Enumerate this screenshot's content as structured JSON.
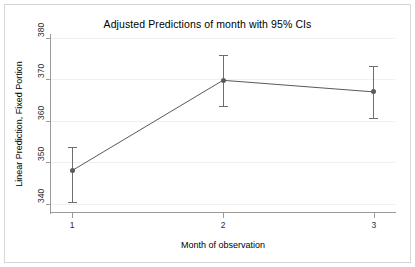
{
  "chart_data": {
    "type": "line",
    "title": "Adjusted Predictions of month with 95% CIs",
    "xlabel": "Month of observation",
    "ylabel": "Linear Prediction, Fixed Portion",
    "x": [
      1,
      2,
      3
    ],
    "xticklabels": [
      "1",
      "2",
      "3"
    ],
    "values": [
      348.0,
      369.8,
      367.0
    ],
    "ci_lower": [
      340.5,
      363.5,
      360.8
    ],
    "ci_upper": [
      353.8,
      375.8,
      373.2
    ],
    "yticks": [
      340,
      350,
      360,
      370,
      380
    ],
    "yticklabels": [
      "340",
      "350",
      "360",
      "370",
      "380"
    ],
    "ylim": [
      338.0,
      380.5
    ],
    "xlim": [
      0.86,
      3.14
    ],
    "grid": true,
    "grid_axis": "y",
    "legend": null,
    "series": [
      {
        "name": "Linear Prediction, Fixed Portion",
        "values": [
          348.0,
          369.8,
          367.0
        ]
      }
    ],
    "colors": {
      "marker": "#5a5a5a",
      "line": "#5a5a5a",
      "whisker": "#6e6e6e",
      "axis": "#9a9a9a",
      "grid": "#f0f0f0",
      "frame": "#d6d6d6",
      "background": "#ffffff",
      "text": "#000000"
    }
  }
}
